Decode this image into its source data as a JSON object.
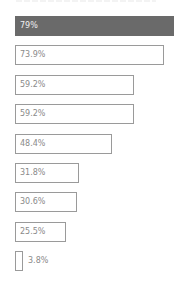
{
  "chart_data": {
    "type": "bar",
    "orientation": "horizontal",
    "title": "",
    "xlabel": "",
    "ylabel": "",
    "categories": [
      "1",
      "2",
      "3",
      "4",
      "5",
      "6",
      "7",
      "8",
      "9"
    ],
    "values": [
      79,
      73.9,
      59.2,
      59.2,
      48.4,
      31.8,
      30.6,
      25.5,
      3.8
    ],
    "labels": [
      "79%",
      "73.9%",
      "59.2%",
      "59.2%",
      "48.4%",
      "31.8%",
      "30.6%",
      "25.5%",
      "3.8%"
    ],
    "xlim": [
      0,
      79
    ],
    "grid": false,
    "legend": "none",
    "highlight_index": 0,
    "colors": {
      "highlight": "#6a6a6a",
      "outline": "#9a9a9a",
      "text": "#8a8a8a"
    }
  },
  "bars": [
    {
      "label": "79%",
      "top": 16,
      "width": 159,
      "filled": true
    },
    {
      "label": "73.9%",
      "top": 45,
      "width": 149
    },
    {
      "label": "59.2%",
      "top": 75,
      "width": 119
    },
    {
      "label": "59.2%",
      "top": 104,
      "width": 119
    },
    {
      "label": "48.4%",
      "top": 134,
      "width": 97
    },
    {
      "label": "31.8%",
      "top": 163,
      "width": 64
    },
    {
      "label": "30.6%",
      "top": 192,
      "width": 62
    },
    {
      "label": "25.5%",
      "top": 222,
      "width": 51
    },
    {
      "label": "3.8%",
      "top": 251,
      "width": 8,
      "outside": true
    }
  ]
}
